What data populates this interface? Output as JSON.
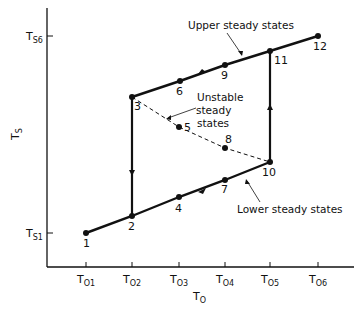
{
  "diagram": {
    "type": "steady-state hysteresis diagram",
    "x_axis": {
      "label": "T",
      "label_sub": "O",
      "ticks": [
        {
          "id": "T01",
          "main": "T",
          "sub": "O1",
          "x": 86
        },
        {
          "id": "T02",
          "main": "T",
          "sub": "O2",
          "x": 132
        },
        {
          "id": "T03",
          "main": "T",
          "sub": "O3",
          "x": 179
        },
        {
          "id": "T04",
          "main": "T",
          "sub": "O4",
          "x": 225
        },
        {
          "id": "T05",
          "main": "T",
          "sub": "O5",
          "x": 270
        },
        {
          "id": "T06",
          "main": "T",
          "sub": "O6",
          "x": 318
        }
      ]
    },
    "y_axis": {
      "label": "T",
      "label_sub": "S",
      "ticks": [
        {
          "id": "TS6",
          "main": "T",
          "sub": "S6",
          "y": 36
        },
        {
          "id": "TS1",
          "main": "T",
          "sub": "S1",
          "y": 233
        }
      ]
    },
    "points": [
      {
        "label": "1",
        "x": 86,
        "y": 233
      },
      {
        "label": "2",
        "x": 132,
        "y": 216
      },
      {
        "label": "3",
        "x": 132,
        "y": 97
      },
      {
        "label": "4",
        "x": 179,
        "y": 197
      },
      {
        "label": "5",
        "x": 179,
        "y": 127
      },
      {
        "label": "6",
        "x": 180,
        "y": 81
      },
      {
        "label": "7",
        "x": 225,
        "y": 180
      },
      {
        "label": "8",
        "x": 225,
        "y": 148
      },
      {
        "label": "9",
        "x": 225,
        "y": 65
      },
      {
        "label": "10",
        "x": 270,
        "y": 162
      },
      {
        "label": "11",
        "x": 270,
        "y": 51
      },
      {
        "label": "12",
        "x": 318,
        "y": 36
      }
    ],
    "annotations": {
      "upper": "Upper steady states",
      "unstable_1": "Unstable",
      "unstable_2": "steady",
      "unstable_3": "states",
      "lower": "Lower steady states"
    },
    "branches": {
      "lower": "1-2-4-7-10",
      "upper": "3-6-9-11-12",
      "unstable": "3-5-8-10 (dashed)",
      "jump_up": "10 to 11",
      "jump_down": "3 to 2"
    }
  }
}
